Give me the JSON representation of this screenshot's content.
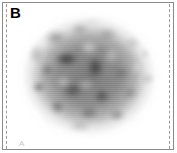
{
  "figure": {
    "panel_letter": "B",
    "orientation_marker": "A",
    "modality": "brain-pet-axial-slice",
    "colormap": "grayscale-inverted",
    "background_color": "#ffffff",
    "border_color": "#8a8a8a",
    "reference_line_color": "#9b9b9b",
    "label_color": "#000000",
    "marker_color": "#c9c9c9",
    "icons": {
      "scan_image": "brain-scan-icon",
      "reference_line": "dashed-reference-line-icon"
    }
  }
}
